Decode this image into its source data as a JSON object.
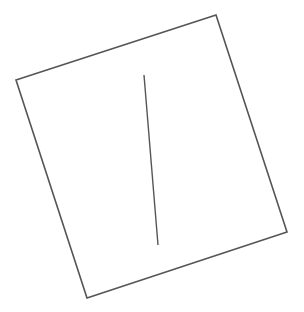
{
  "canvas": {
    "width": 304,
    "height": 312,
    "background": "#ffffff"
  },
  "diagram": {
    "stroke_color": "#555555",
    "outline": {
      "label": "rotated-quadrilateral",
      "points": [
        [
          16,
          80
        ],
        [
          216,
          15
        ],
        [
          287,
          232
        ],
        [
          87,
          298
        ]
      ],
      "stroke_width": 1.6
    },
    "inner_line": {
      "label": "inner-line",
      "x1": 144,
      "y1": 75,
      "x2": 158,
      "y2": 245,
      "stroke_width": 1.4
    }
  }
}
